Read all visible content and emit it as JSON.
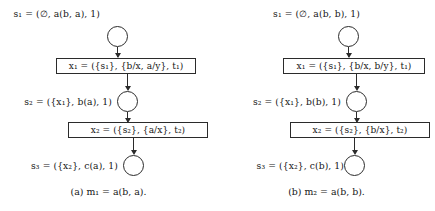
{
  "figure": {
    "type": "derivation-diagram-pair",
    "panels": [
      {
        "id": "a",
        "caption": "(a) m₁ = a(b, a).",
        "nodes": [
          {
            "id": "s1",
            "label": "s₁ = (∅, a(b, a), 1)"
          },
          {
            "id": "s2",
            "label": "s₂ = ({x₁}, b(a), 1)"
          },
          {
            "id": "s3",
            "label": "s₃ = ({x₂}, c(a), 1)"
          }
        ],
        "transitions": [
          {
            "id": "x1",
            "label": "x₁ = ({s₁}, {b/x, a/y}, t₁)"
          },
          {
            "id": "x2",
            "label": "x₂ = ({s₂}, {a/x}, t₂)"
          }
        ]
      },
      {
        "id": "b",
        "caption": "(b) m₂ = a(b, b).",
        "nodes": [
          {
            "id": "s1",
            "label": "s₁ = (∅, a(b, b), 1)"
          },
          {
            "id": "s2",
            "label": "s₂ = ({x₁}, b(b), 1)"
          },
          {
            "id": "s3",
            "label": "s₃ = ({x₂}, c(b), 1)"
          }
        ],
        "transitions": [
          {
            "id": "x1",
            "label": "x₁ = ({s₁}, {b/x, b/y}, t₁)"
          },
          {
            "id": "x2",
            "label": "x₂ = ({s₂}, {b/x}, t₂)"
          }
        ]
      }
    ],
    "colors": {
      "stroke": "#2b2b2b",
      "text": "#151515",
      "background": "#ffffff"
    }
  }
}
